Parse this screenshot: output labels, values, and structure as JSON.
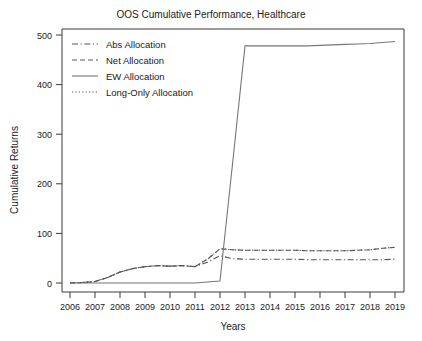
{
  "chart_data": {
    "type": "line",
    "title": "OOS Cumulative Performance, Healthcare",
    "xlabel": "Years",
    "ylabel": "Cumulative Returns",
    "grid": false,
    "legend_position": "top-left",
    "xlim": [
      2006,
      2019
    ],
    "ylim": [
      0,
      500
    ],
    "xticks": [
      2006,
      2007,
      2008,
      2009,
      2010,
      2011,
      2012,
      2013,
      2014,
      2015,
      2016,
      2017,
      2018,
      2019
    ],
    "xtick_labels": [
      "2006",
      "2007",
      "2008",
      "2009",
      "2010",
      "2011",
      "2012",
      "2013",
      "2014",
      "2015",
      "2016",
      "2017",
      "2018",
      "2019"
    ],
    "yticks": [
      0,
      100,
      200,
      300,
      400,
      500
    ],
    "ytick_labels": [
      "0",
      "100",
      "200",
      "300",
      "400",
      "500"
    ],
    "x": [
      2006,
      2006.5,
      2007,
      2007.5,
      2008,
      2008.5,
      2009,
      2009.5,
      2010,
      2010.5,
      2011,
      2011.5,
      2012,
      2012.5,
      2013,
      2013.5,
      2014,
      2014.5,
      2015,
      2015.5,
      2016,
      2016.5,
      2017,
      2017.5,
      2018,
      2018.5,
      2019
    ],
    "series": [
      {
        "name": "Abs Allocation",
        "style": "dash-dot",
        "color": "#555555",
        "values": [
          0,
          1,
          3,
          11,
          22,
          29,
          33,
          35,
          34,
          35,
          33,
          42,
          55,
          49,
          48,
          48,
          48,
          48,
          48,
          47,
          47,
          47,
          47,
          47,
          47,
          47,
          48
        ]
      },
      {
        "name": "Net Allocation",
        "style": "dashed",
        "color": "#555555",
        "values": [
          0,
          1,
          3,
          11,
          22,
          29,
          33,
          35,
          34,
          35,
          33,
          48,
          69,
          67,
          66,
          66,
          66,
          66,
          66,
          65,
          65,
          65,
          65,
          66,
          67,
          70,
          72
        ]
      },
      {
        "name": "EW Allocation",
        "style": "solid",
        "color": "#777777",
        "values": [
          0,
          0,
          0,
          0,
          0,
          0,
          0,
          0,
          0,
          0,
          0,
          2,
          4,
          240,
          478,
          478,
          478,
          478,
          478,
          478,
          479,
          480,
          481,
          482,
          483,
          485,
          487
        ]
      },
      {
        "name": "Long-Only Allocation",
        "style": "dotted",
        "color": "#555555",
        "values": [
          0,
          1,
          3,
          11,
          22,
          29,
          33,
          35,
          34,
          35,
          33,
          48,
          69,
          67,
          66,
          66,
          66,
          66,
          66,
          65,
          65,
          65,
          65,
          66,
          67,
          70,
          72
        ]
      }
    ]
  },
  "legend": {
    "items": [
      {
        "label": "Abs Allocation",
        "style": "dash-dot"
      },
      {
        "label": "Net Allocation",
        "style": "dashed"
      },
      {
        "label": "EW Allocation",
        "style": "solid"
      },
      {
        "label": "Long-Only Allocation",
        "style": "dotted"
      }
    ]
  }
}
